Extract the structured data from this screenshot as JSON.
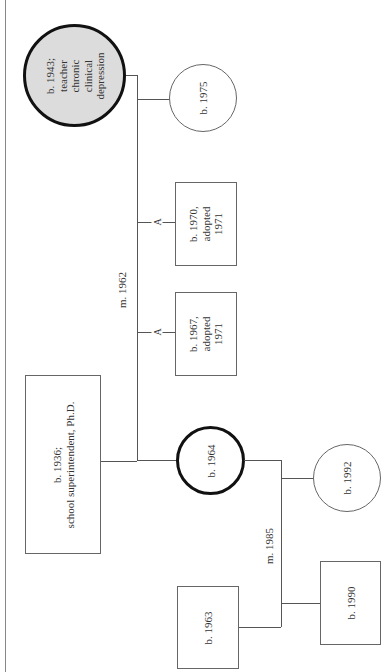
{
  "genogram": {
    "orientation": "rotated-90-ccw",
    "colors": {
      "line": "#555555",
      "shaded_fill": "#dcdcdc",
      "thick_border": "#111111"
    },
    "people": {
      "mother": {
        "shape": "circle",
        "shaded": true,
        "bold": true,
        "lines": [
          "b. 1943;",
          "teacher",
          "chronic",
          "clinical",
          "depression"
        ]
      },
      "father": {
        "shape": "square",
        "lines": [
          "b. 1936;",
          "school superintendent, Ph.D."
        ]
      },
      "daughter_1975": {
        "shape": "circle",
        "lines": [
          "b. 1975"
        ]
      },
      "adopted_son_1970": {
        "shape": "square",
        "lines": [
          "b. 1970,",
          "adopted",
          "1971"
        ]
      },
      "adopted_son_1967": {
        "shape": "square",
        "lines": [
          "b. 1967,",
          "adopted",
          "1971"
        ]
      },
      "index_person": {
        "shape": "circle",
        "bold": true,
        "lines": [
          "b. 1964"
        ]
      },
      "spouse": {
        "shape": "square",
        "lines": [
          "b. 1963"
        ]
      },
      "grandchild_son": {
        "shape": "square",
        "lines": [
          "b. 1990"
        ]
      },
      "grandchild_daughter": {
        "shape": "circle",
        "lines": [
          "b. 1992"
        ]
      }
    },
    "relationships": {
      "parents_marriage": "m. 1962",
      "child_marriage": "m. 1985",
      "adoption_marker": "A"
    }
  }
}
